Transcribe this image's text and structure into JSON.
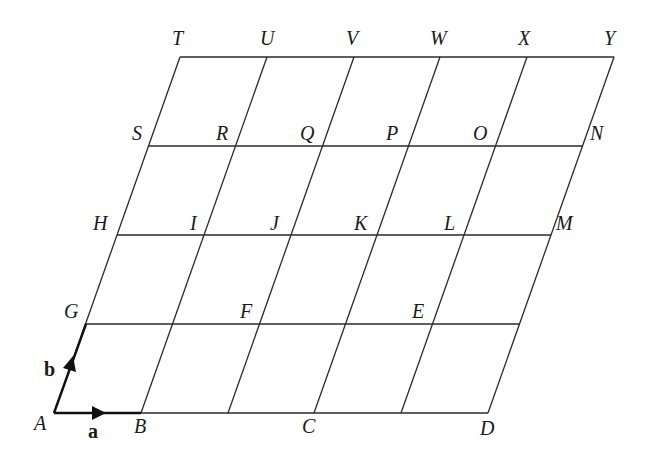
{
  "diagram": {
    "grid": {
      "columns": 5,
      "rows": 4,
      "line_color": "#2a2a2a"
    },
    "vectors": [
      {
        "name": "a",
        "from": "A",
        "to": "B"
      },
      {
        "name": "b",
        "from": "A",
        "to": "G"
      }
    ],
    "labels": {
      "A": "A",
      "B": "B",
      "C": "C",
      "D": "D",
      "E": "E",
      "F": "F",
      "G": "G",
      "H": "H",
      "I": "I",
      "J": "J",
      "K": "K",
      "L": "L",
      "M": "M",
      "N": "N",
      "O": "O",
      "P": "P",
      "Q": "Q",
      "R": "R",
      "S": "S",
      "T": "T",
      "U": "U",
      "V": "V",
      "W": "W",
      "X": "X",
      "Y": "Y",
      "a": "a",
      "b": "b"
    },
    "rows_points": {
      "row0": [
        "A",
        "B",
        "",
        "C",
        "",
        "D"
      ],
      "row1": [
        "G",
        "",
        "F",
        "",
        "E",
        ""
      ],
      "row2": [
        "H",
        "I",
        "J",
        "K",
        "L",
        "M"
      ],
      "row3": [
        "S",
        "R",
        "Q",
        "P",
        "O",
        "N"
      ],
      "row4": [
        "T",
        "U",
        "V",
        "W",
        "X",
        "Y"
      ]
    }
  }
}
